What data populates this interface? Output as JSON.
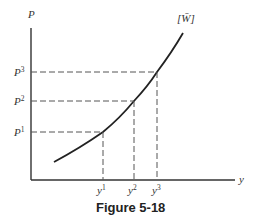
{
  "figure": {
    "caption": "Figure 5-18",
    "y_axis_label": "P",
    "x_axis_label": "y",
    "curve_label": "[W̄]",
    "price_levels": [
      {
        "base": "P",
        "sup": "1"
      },
      {
        "base": "P",
        "sup": "2"
      },
      {
        "base": "P",
        "sup": "3"
      }
    ],
    "output_levels": [
      {
        "base": "y",
        "sup": "1"
      },
      {
        "base": "y",
        "sup": "2"
      },
      {
        "base": "y",
        "sup": "3"
      }
    ]
  }
}
